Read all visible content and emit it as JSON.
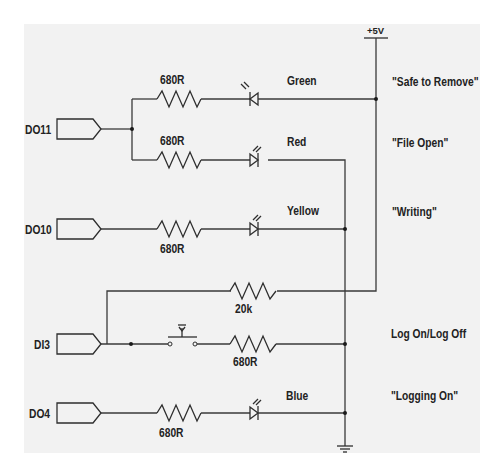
{
  "diagram": {
    "type": "circuit-schematic",
    "supply": {
      "label": "+5V"
    },
    "ground": {
      "label": ""
    },
    "ports": [
      {
        "id": "DO11",
        "label": "DO11"
      },
      {
        "id": "DO10",
        "label": "DO10"
      },
      {
        "id": "DI3",
        "label": "DI3"
      },
      {
        "id": "DO4",
        "label": "DO4"
      }
    ],
    "branches": [
      {
        "id": "green",
        "resistor": "680R",
        "led": "Green",
        "meaning": "\"Safe to Remove\"",
        "port": "DO11"
      },
      {
        "id": "red",
        "resistor": "680R",
        "led": "Red",
        "meaning": "\"File Open\"",
        "port": "DO11"
      },
      {
        "id": "yellow",
        "resistor": "680R",
        "led": "Yellow",
        "meaning": "\"Writing\"",
        "port": "DO10"
      },
      {
        "id": "pullup",
        "resistor": "20k",
        "led": "",
        "meaning": "",
        "port": "DI3"
      },
      {
        "id": "switch",
        "resistor": "680R",
        "led": "",
        "meaning": "Log On/Log Off",
        "port": "DI3"
      },
      {
        "id": "blue",
        "resistor": "680R",
        "led": "Blue",
        "meaning": "\"Logging On\"",
        "port": "DO4"
      }
    ]
  }
}
